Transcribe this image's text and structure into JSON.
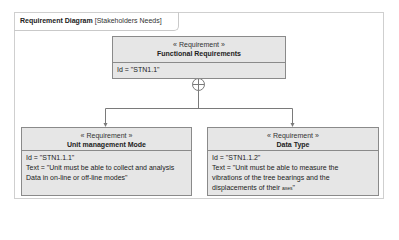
{
  "diagram": {
    "kind_label": "Requirement Diagram",
    "name_label": "[Stakeholders Needs]"
  },
  "requirements": {
    "top": {
      "stereotype": "« Requirement »",
      "title": "Functional Requirements",
      "id_line": "Id = \"STN1.1\""
    },
    "left": {
      "stereotype": "« Requirement »",
      "title": "Unit management Mode",
      "id_line": "Id = \"STN1.1.1\"",
      "text_line1": "Text = \"Unit must be able to collect and analysis",
      "text_line2": "Data in on-line or off-line modes\""
    },
    "right": {
      "stereotype": "« Requirement »",
      "title": "Data Type",
      "id_line": "Id = \"STN1.1.2\"",
      "text_line1": "Text = \"Unit must be able to measure the",
      "text_line2": "vibrations of the tree bearings and the",
      "text_line3a": "displacements of their ",
      "text_line3b": "axes",
      "text_line3c": "\""
    }
  },
  "relationship": {
    "type": "containment",
    "icon": "circle-plus-icon"
  }
}
